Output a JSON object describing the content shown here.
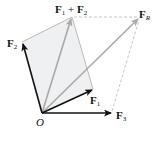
{
  "diagram": {
    "type": "vector-addition",
    "origin": {
      "label": "O",
      "x": 42,
      "y": 113
    },
    "vectors": [
      {
        "id": "F1",
        "base": "F",
        "sub": "1",
        "tip": {
          "x": 93,
          "y": 89
        },
        "style": "solid-black",
        "label_pos": {
          "x": 90,
          "y": 104
        }
      },
      {
        "id": "F2",
        "base": "F",
        "sub": "2",
        "tip": {
          "x": 22,
          "y": 42
        },
        "style": "solid-black",
        "label_pos": {
          "x": 7,
          "y": 47
        }
      },
      {
        "id": "F3",
        "base": "F",
        "sub": "3",
        "tip": {
          "x": 112,
          "y": 113
        },
        "style": "solid-black",
        "label_pos": {
          "x": 116,
          "y": 119
        }
      },
      {
        "id": "F1+F2",
        "tip": {
          "x": 72,
          "y": 17
        },
        "style": "solid-gray",
        "label_pos": {
          "x": 55,
          "y": 12
        }
      },
      {
        "id": "FR",
        "base": "F",
        "sub": "R",
        "tip": {
          "x": 140,
          "y": 17
        },
        "style": "solid-gray",
        "label_pos": {
          "x": 140,
          "y": 16
        }
      }
    ],
    "labels": {
      "origin": "O",
      "f1_base": "F",
      "f1_sub": "1",
      "f2_base": "F",
      "f2_sub": "2",
      "f3_base": "F",
      "f3_sub": "3",
      "sum12_a_base": "F",
      "sum12_a_sub": "1",
      "sum12_plus": " + ",
      "sum12_b_base": "F",
      "sum12_b_sub": "2",
      "fr_base": "F",
      "fr_sub": "R"
    },
    "parallelogram": {
      "points": [
        [
          42,
          113
        ],
        [
          93,
          89
        ],
        [
          72,
          17
        ],
        [
          22,
          42
        ]
      ],
      "fill": "#eef0f2",
      "edge": "#a8a8a8"
    },
    "dashed_construction": [
      {
        "from": [
          72,
          17
        ],
        "to": [
          140,
          17
        ]
      },
      {
        "from": [
          112,
          113
        ],
        "to": [
          140,
          17
        ]
      }
    ],
    "colors": {
      "black_vector": "#111111",
      "gray_vector": "#a9a9a9",
      "dashed": "#b8b8b8",
      "fill": "#eef0f2"
    }
  }
}
